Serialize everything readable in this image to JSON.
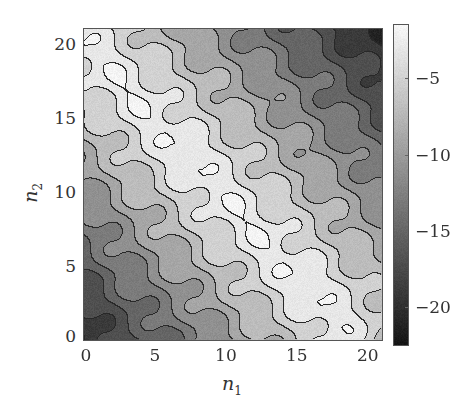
{
  "chart_data": {
    "type": "heatmap",
    "subtype": "filled-contour",
    "title": "",
    "xlabel": "n1",
    "ylabel": "n2",
    "xlabel_parts": {
      "base": "n",
      "sub": "1"
    },
    "ylabel_parts": {
      "base": "n",
      "sub": "2"
    },
    "xlim": [
      0,
      21
    ],
    "ylim": [
      0,
      21
    ],
    "x_ticks": [
      0,
      5,
      10,
      15,
      20
    ],
    "y_ticks": [
      0,
      5,
      10,
      15,
      20
    ],
    "x_tick_labels": [
      "0",
      "5",
      "10",
      "15",
      "20"
    ],
    "y_tick_labels": [
      "0",
      "5",
      "10",
      "15",
      "20"
    ],
    "colorbar": {
      "range": [
        -22.5,
        -1.5
      ],
      "ticks": [
        -5,
        -10,
        -15,
        -20
      ],
      "tick_labels": [
        "−5",
        "−10",
        "−15",
        "−20"
      ],
      "colormap": "gray",
      "low_color": "#141414",
      "high_color": "#f7f7f7"
    },
    "contour_levels": [
      -20,
      -18,
      -16,
      -14,
      -12,
      -10,
      -8,
      -6,
      -4,
      -2
    ],
    "grid": false,
    "model": {
      "ridge_start": [
        0,
        20
      ],
      "ridge_end": [
        18,
        1
      ],
      "ridge_peak": -2,
      "falloff_per_unit": 1.25,
      "corner_min": -22.5
    }
  }
}
